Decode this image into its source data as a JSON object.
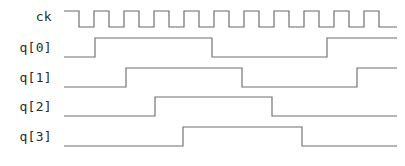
{
  "figure": {
    "background_color": "#ffffff",
    "wave_color": "#6f6f6f",
    "label_color": "#2b2b2b",
    "width": 405,
    "height": 166
  },
  "signals": [
    {
      "name": "clock",
      "label": "ck",
      "label_x": 52,
      "label_y": 21
    },
    {
      "name": "q0",
      "label": "q[0]",
      "label_x": 52,
      "label_y": 52
    },
    {
      "name": "q1",
      "label": "q[1]",
      "label_x": 52,
      "label_y": 82
    },
    {
      "name": "q2",
      "label": "q[2]",
      "label_x": 52,
      "label_y": 111
    },
    {
      "name": "q3",
      "label": "q[3]",
      "label_x": 52,
      "label_y": 141
    }
  ],
  "chart_data": {
    "type": "line",
    "xlabel": "",
    "ylabel": "",
    "signal_names": [
      "ck",
      "q[0]",
      "q[1]",
      "q[2]",
      "q[3]"
    ],
    "time_axis": {
      "start_px": 64,
      "end_px": 397,
      "clock_period_px": 30,
      "clock_cycles": 11
    },
    "rows": [
      {
        "name": "ck",
        "high_y": 11,
        "low_y": 27
      },
      {
        "name": "q[0]",
        "high_y": 38,
        "low_y": 57
      },
      {
        "name": "q[1]",
        "high_y": 68,
        "low_y": 87
      },
      {
        "name": "q[2]",
        "high_y": 97,
        "low_y": 116
      },
      {
        "name": "q[3]",
        "high_y": 127,
        "low_y": 146
      }
    ],
    "series": [
      {
        "name": "ck",
        "initial_level": 1,
        "start_px": 64,
        "end_px": 397,
        "edges_px": [
          79,
          94,
          109,
          124,
          139,
          154,
          169,
          184,
          199,
          214,
          229,
          244,
          259,
          274,
          289,
          304,
          319,
          334,
          349,
          364,
          379
        ],
        "levels": [
          1,
          0,
          1,
          0,
          1,
          0,
          1,
          0,
          1,
          0,
          1,
          0,
          1,
          0,
          1,
          0,
          1,
          0,
          1,
          0,
          1,
          0
        ],
        "description": "free running clock, 11 pulses, period 30px"
      },
      {
        "name": "q[0]",
        "initial_level": 0,
        "start_px": 64,
        "end_px": 397,
        "edges_px": [
          95,
          212,
          327
        ],
        "levels": [
          0,
          1,
          0,
          1
        ],
        "description": "toggles on clock, divide by 2"
      },
      {
        "name": "q[1]",
        "initial_level": 0,
        "start_px": 64,
        "end_px": 397,
        "edges_px": [
          126,
          242,
          357
        ],
        "levels": [
          0,
          1,
          0,
          1
        ],
        "description": "divide by 4"
      },
      {
        "name": "q[2]",
        "initial_level": 0,
        "start_px": 64,
        "end_px": 397,
        "edges_px": [
          155,
          272
        ],
        "levels": [
          0,
          1,
          0
        ],
        "description": "divide by 8"
      },
      {
        "name": "q[3]",
        "initial_level": 0,
        "start_px": 64,
        "end_px": 397,
        "edges_px": [
          183,
          302
        ],
        "levels": [
          0,
          1,
          0
        ],
        "description": "divide by 16"
      }
    ]
  }
}
